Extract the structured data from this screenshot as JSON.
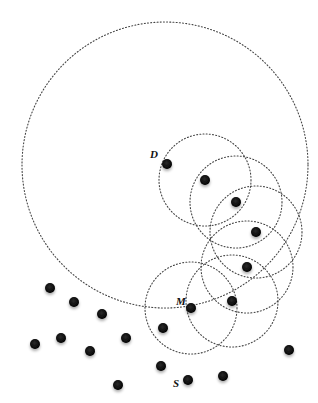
{
  "diagram": {
    "width": 318,
    "height": 403,
    "colors": {
      "node": "#111111",
      "circle": "#444444",
      "background": "#ffffff"
    },
    "labels": [
      {
        "text": "D",
        "x": 150,
        "y": 158
      },
      {
        "text": "M",
        "x": 176,
        "y": 305
      },
      {
        "text": "S",
        "x": 173,
        "y": 387
      }
    ],
    "large_circle": {
      "cx": 165,
      "cy": 165,
      "r": 143
    },
    "range_circles": [
      {
        "cx": 205,
        "cy": 180,
        "r": 46
      },
      {
        "cx": 236,
        "cy": 202,
        "r": 46
      },
      {
        "cx": 256,
        "cy": 232,
        "r": 46
      },
      {
        "cx": 247,
        "cy": 267,
        "r": 46
      },
      {
        "cx": 232,
        "cy": 301,
        "r": 46
      },
      {
        "cx": 191,
        "cy": 308,
        "r": 46
      }
    ],
    "nodes": [
      {
        "id": "D",
        "x": 167,
        "y": 164
      },
      {
        "x": 205,
        "y": 180
      },
      {
        "x": 236,
        "y": 202
      },
      {
        "x": 256,
        "y": 232
      },
      {
        "x": 247,
        "y": 267
      },
      {
        "x": 232,
        "y": 301
      },
      {
        "id": "M",
        "x": 191,
        "y": 308
      },
      {
        "x": 163,
        "y": 328
      },
      {
        "x": 161,
        "y": 366
      },
      {
        "id": "S",
        "x": 188,
        "y": 380
      },
      {
        "x": 223,
        "y": 376
      },
      {
        "x": 289,
        "y": 350
      },
      {
        "x": 50,
        "y": 288
      },
      {
        "x": 74,
        "y": 302
      },
      {
        "x": 102,
        "y": 314
      },
      {
        "x": 35,
        "y": 344
      },
      {
        "x": 61,
        "y": 338
      },
      {
        "x": 90,
        "y": 351
      },
      {
        "x": 126,
        "y": 338
      },
      {
        "x": 118,
        "y": 385
      }
    ]
  }
}
